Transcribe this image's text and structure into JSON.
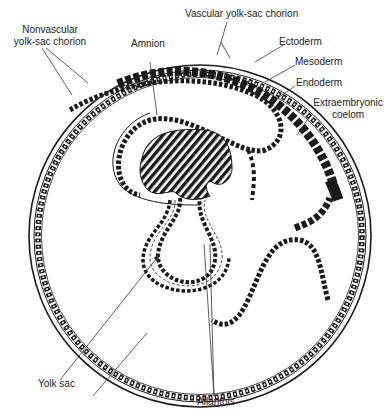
{
  "diagram": {
    "labels": {
      "nonvascular_line1": "Nonvascular",
      "nonvascular_line2": "yolk-sac chorion",
      "vascular": "Vascular yolk-sac chorion",
      "amnion": "Amnion",
      "ectoderm": "Ectoderm",
      "mesoderm": "Mesoderm",
      "endoderm": "Endoderm",
      "extraembryonic_line1": "Extraembryonic",
      "extraembryonic_line2": "coelom",
      "yolk_sac": "Yolk sac",
      "allantois": "Allantois"
    },
    "colors": {
      "ink": "#1a1a1a",
      "background": "#ffffff"
    }
  }
}
